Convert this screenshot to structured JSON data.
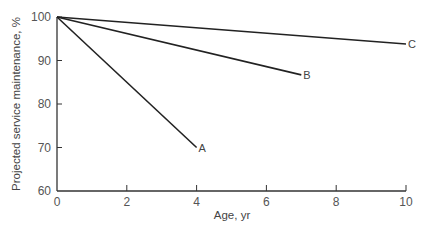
{
  "chart_data": {
    "type": "line",
    "title": "",
    "xlabel": "Age, yr",
    "ylabel": "Projected service maintenance, %",
    "xlim": [
      0,
      10
    ],
    "ylim": [
      60,
      100
    ],
    "xticks": [
      0,
      2,
      4,
      6,
      8,
      10
    ],
    "yticks": [
      60,
      70,
      80,
      90,
      100
    ],
    "grid": false,
    "legend": "inline labels at line ends",
    "series": [
      {
        "name": "A",
        "x": [
          0,
          4
        ],
        "y": [
          100,
          70
        ]
      },
      {
        "name": "B",
        "x": [
          0,
          7
        ],
        "y": [
          100,
          86.7
        ]
      },
      {
        "name": "C",
        "x": [
          0,
          10
        ],
        "y": [
          100,
          93.8
        ]
      }
    ],
    "colors": {
      "line": "#222222",
      "axis": "#333333",
      "text": "#555555"
    }
  }
}
